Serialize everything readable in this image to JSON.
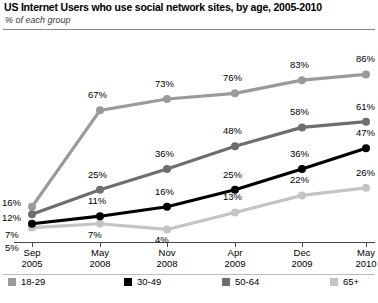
{
  "header": {
    "title": "US Internet Users who use social network sites, by age, 2005-2010",
    "subtitle": "% of each group"
  },
  "legend": [
    {
      "label": "18-29",
      "color": "#9a9a9a",
      "x": 8
    },
    {
      "label": "30-49",
      "color": "#000000",
      "x": 124
    },
    {
      "label": "50-64",
      "color": "#6e6e6e",
      "x": 222
    },
    {
      "label": "65+",
      "color": "#c4c4c4",
      "x": 330
    }
  ],
  "chart_data": {
    "type": "line",
    "title": "US Internet Users who use social network sites, by age, 2005-2010",
    "subtitle": "% of each group",
    "xlabel": "",
    "ylabel": "% of each group",
    "ylim": [
      0,
      100
    ],
    "grid": false,
    "legend_position": "bottom",
    "categories": [
      "Sep 2005",
      "May 2008",
      "Nov 2008",
      "Apr 2009",
      "Dec 2009",
      "May 2010"
    ],
    "category_lines": [
      [
        "Sep",
        "2005"
      ],
      [
        "May",
        "2008"
      ],
      [
        "Nov",
        "2008"
      ],
      [
        "Apr",
        "2009"
      ],
      [
        "Dec",
        "2009"
      ],
      [
        "May",
        "2010"
      ]
    ],
    "series": [
      {
        "name": "18-29",
        "color": "#9a9a9a",
        "values": [
          16,
          67,
          73,
          76,
          83,
          86
        ],
        "labels": [
          "16%",
          "67%",
          "73%",
          "76%",
          "83%",
          "86%"
        ]
      },
      {
        "name": "30-49",
        "color": "#000000",
        "values": [
          7,
          11,
          16,
          25,
          36,
          47
        ],
        "labels": [
          "7%",
          "11%",
          "16%",
          "25%",
          "36%",
          "47%"
        ]
      },
      {
        "name": "50-64",
        "color": "#6e6e6e",
        "values": [
          12,
          25,
          36,
          48,
          58,
          61
        ],
        "labels": [
          "12%",
          "25%",
          "36%",
          "48%",
          "58%",
          "61%"
        ]
      },
      {
        "name": "65+",
        "color": "#c4c4c4",
        "values": [
          5,
          7,
          4,
          13,
          22,
          26
        ],
        "labels": [
          "5%",
          "7%",
          "4%",
          "13%",
          "22%",
          "26%"
        ]
      }
    ]
  }
}
